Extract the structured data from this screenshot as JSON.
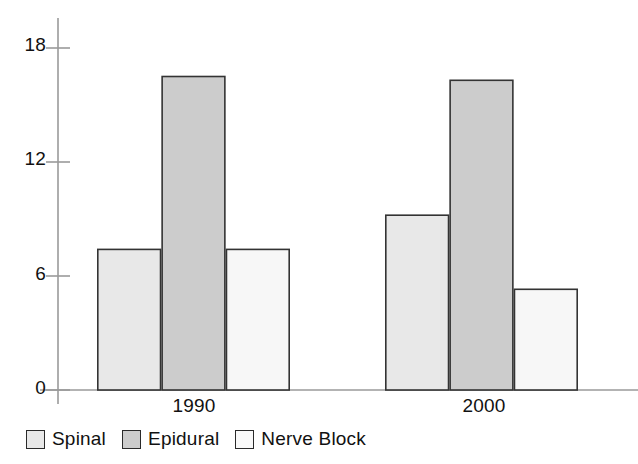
{
  "chart_data": {
    "type": "bar",
    "title": "",
    "subtitle": "",
    "xlabel": "",
    "ylabel": "",
    "categories": [
      "1990",
      "2000"
    ],
    "series": [
      {
        "name": "Spinal",
        "values": [
          7.4,
          9.2
        ],
        "color": "#e8e8e8"
      },
      {
        "name": "Epidural",
        "values": [
          16.5,
          16.3
        ],
        "color": "#cccccc"
      },
      {
        "name": "Nerve Block",
        "values": [
          7.4,
          5.3
        ],
        "color": "#f7f7f7"
      }
    ],
    "ylim": [
      0,
      19.6
    ],
    "yticks": [
      0,
      6,
      12,
      18
    ],
    "ytick_labels": [
      "0",
      "6",
      "12",
      "18"
    ],
    "grid": false,
    "legend_position": "bottom-left",
    "bar_border_color": "#333333",
    "axis_color": "#999999"
  },
  "axes": {
    "y_tick_labels": [
      "18",
      "12",
      "6",
      "0"
    ],
    "x_tick_labels": [
      "1990",
      "2000"
    ]
  },
  "legend": {
    "items": [
      {
        "label": "Spinal",
        "swatch_color": "#e8e8e8"
      },
      {
        "label": "Epidural",
        "swatch_color": "#cccccc"
      },
      {
        "label": "Nerve Block",
        "swatch_color": "#f9f9f9"
      }
    ]
  }
}
